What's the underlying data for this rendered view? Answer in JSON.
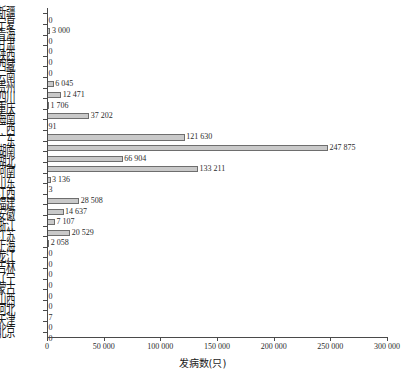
{
  "chart_data": {
    "type": "bar",
    "orientation": "horizontal",
    "title": "",
    "xlabel": "发病数(只)",
    "ylabel": "",
    "xlim": [
      0,
      300000
    ],
    "xticks": [
      0,
      50000,
      100000,
      150000,
      200000,
      250000,
      300000
    ],
    "xtick_labels": [
      "0",
      "50 000",
      "100 000",
      "150 000",
      "200 000",
      "250 000",
      "300 000"
    ],
    "grid": false,
    "legend": null,
    "bar_fill": "#c9c9c9",
    "bar_edge": "#6e6e6e",
    "categories": [
      "新疆",
      "宁夏",
      "青海",
      "甘肃",
      "陕西",
      "西藏",
      "云南",
      "贵州",
      "四川",
      "重庆",
      "海南",
      "广西",
      "广东",
      "湖南",
      "湖北",
      "河南",
      "山东",
      "江西",
      "福建",
      "安徽",
      "浙江",
      "江苏",
      "上海",
      "黑龙江",
      "吉林",
      "辽宁",
      "内蒙古",
      "山西",
      "河北",
      "天津",
      "北京"
    ],
    "values": [
      0,
      3000,
      0,
      0,
      0,
      0,
      6045,
      12471,
      1706,
      37202,
      91,
      121630,
      247875,
      66904,
      133211,
      3136,
      3,
      28508,
      14637,
      7107,
      20529,
      2058,
      0,
      0,
      0,
      0,
      0,
      0,
      7,
      0,
      0
    ],
    "value_labels": [
      "0",
      "3 000",
      "0",
      "0",
      "0",
      "0",
      "6 045",
      "12 471",
      "1 706",
      "37 202",
      "91",
      "121 630",
      "247 875",
      "66 904",
      "133 211",
      "3 136",
      "3",
      "28 508",
      "14 637",
      "7 107",
      "20 529",
      "2 058",
      "0",
      "0",
      "0",
      "0",
      "0",
      "0",
      "7",
      "0",
      "0"
    ]
  }
}
